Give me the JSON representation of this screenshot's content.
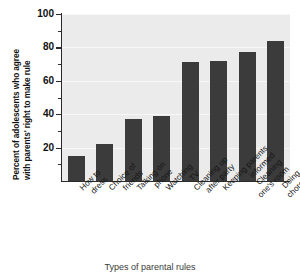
{
  "chart_data": {
    "type": "bar",
    "title": "",
    "xlabel": "Types of parental rules",
    "ylabel_line1": "Percent of adolescents who agree",
    "ylabel_line2": "with parents' right to make rule",
    "categories": [
      "How to dress",
      "Choice of friends",
      "Talking on phone",
      "Watching TV",
      "Cleaning up after party",
      "Keeping parents informed",
      "Cleaning one's room",
      "Doing chores"
    ],
    "category_lines": [
      [
        "How to",
        "dress"
      ],
      [
        "Choice of",
        "friends"
      ],
      [
        "Talking on",
        "phone"
      ],
      [
        "Watching",
        "TV"
      ],
      [
        "Cleaning up",
        "after party"
      ],
      [
        "Keeping parents",
        "informed"
      ],
      [
        "Cleaning",
        "one's room"
      ],
      [
        "Doing",
        "chores"
      ]
    ],
    "values": [
      15,
      22,
      37,
      39,
      71,
      72,
      77,
      84
    ],
    "ylim": [
      0,
      100
    ],
    "ytick_labels": [
      "20",
      "40",
      "60",
      "80",
      "100"
    ],
    "ytick_values": [
      20,
      40,
      60,
      80,
      100
    ],
    "yminor_values": [
      10,
      30,
      50,
      70,
      90
    ],
    "grid": true,
    "legend": "none",
    "bar_color": "#3b3b3b",
    "plot_background": "#ebebeb",
    "gridline_color": "#f7f7f7"
  }
}
